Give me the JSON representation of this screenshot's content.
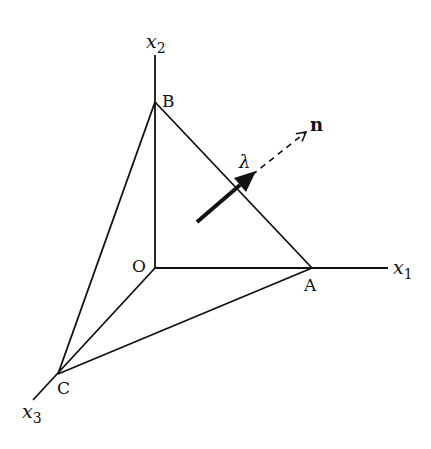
{
  "diagram": {
    "points": {
      "O": {
        "label": "O",
        "x": 155,
        "y": 268
      },
      "A": {
        "label": "A",
        "x": 312,
        "y": 268
      },
      "B": {
        "label": "B",
        "x": 155,
        "y": 102
      },
      "C": {
        "label": "C",
        "x": 58,
        "y": 374
      }
    },
    "axes": {
      "x1": {
        "label_base": "x",
        "label_sub": "1"
      },
      "x2": {
        "label_base": "x",
        "label_sub": "2"
      },
      "x3": {
        "label_base": "x",
        "label_sub": "3"
      }
    },
    "vectors": {
      "traction": {
        "label": "λ",
        "style": "solid-thick"
      },
      "normal": {
        "label": "n",
        "style": "dashed"
      }
    },
    "colors": {
      "stroke": "#111111",
      "background": "#ffffff"
    }
  }
}
